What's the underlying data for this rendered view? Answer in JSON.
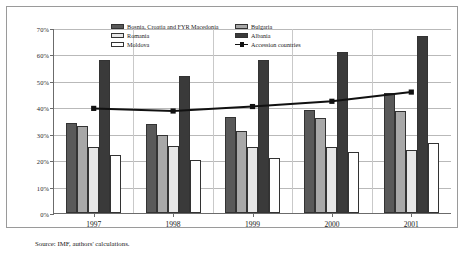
{
  "chart_data": {
    "type": "bar",
    "title": "",
    "subtitle": "",
    "xlabel": "",
    "ylabel": "",
    "categories": [
      "1997",
      "1998",
      "1999",
      "2000",
      "2001"
    ],
    "ylim": [
      0,
      70
    ],
    "ytick_labels": [
      "0%",
      "10%",
      "20%",
      "30%",
      "40%",
      "50%",
      "60%",
      "70%"
    ],
    "ytick_values": [
      0,
      10,
      20,
      30,
      40,
      50,
      60,
      70
    ],
    "grid": true,
    "legend_position": "top-center-inside",
    "series": [
      {
        "name": "Bosnia, Croatia and FYR Macedonia",
        "kind": "bar",
        "color": "#595959",
        "values": [
          34.0,
          33.5,
          36.3,
          39.0,
          45.5
        ]
      },
      {
        "name": "Bulgaria",
        "kind": "bar",
        "color": "#a8a8a8",
        "values": [
          33.0,
          29.5,
          31.0,
          35.8,
          38.5
        ]
      },
      {
        "name": "Romania",
        "kind": "bar",
        "color": "#e6e6e6",
        "values": [
          25.0,
          25.5,
          25.0,
          25.0,
          24.0
        ]
      },
      {
        "name": "Albania",
        "kind": "bar",
        "color": "#3a3a3a",
        "values": [
          58.0,
          52.0,
          58.0,
          61.0,
          67.0
        ]
      },
      {
        "name": "Moldova",
        "kind": "bar",
        "color": "#ffffff",
        "values": [
          22.0,
          20.0,
          21.0,
          23.0,
          26.5
        ]
      },
      {
        "name": "Accession countries",
        "kind": "line",
        "color": "#111111",
        "marker": "square",
        "values": [
          39.8,
          38.8,
          40.5,
          42.5,
          46.0
        ]
      }
    ]
  },
  "legend": {
    "left_column": [
      {
        "label": "Bosnia, Croatia and FYR Macedonia",
        "swatch": "s0"
      },
      {
        "label": "Romania",
        "swatch": "s2"
      },
      {
        "label": "Moldova",
        "swatch": "s4"
      }
    ],
    "right_column": [
      {
        "label": "Bulgaria",
        "swatch": "s1"
      },
      {
        "label": "Albania",
        "swatch": "s3"
      },
      {
        "label": "Accession countries",
        "swatch": "line"
      }
    ]
  },
  "footer": {
    "source": "Source: IMF, authors' calculations."
  }
}
